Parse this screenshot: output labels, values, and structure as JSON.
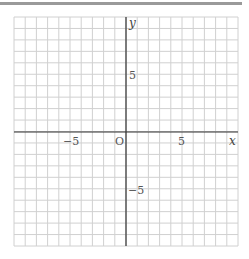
{
  "chart_data": {
    "type": "scatter",
    "title": "",
    "xlabel": "x",
    "ylabel": "y",
    "origin_label": "O",
    "xlim": [
      -10,
      10
    ],
    "ylim": [
      -10,
      10
    ],
    "grid": true,
    "grid_step": 1,
    "x_ticks": [
      {
        "value": -5,
        "label": "−5"
      },
      {
        "value": 5,
        "label": "5"
      }
    ],
    "y_ticks": [
      {
        "value": 5,
        "label": "5"
      },
      {
        "value": -5,
        "label": "−5"
      }
    ],
    "series": []
  },
  "colors": {
    "grid": "#d0d0d0",
    "axis": "#333333",
    "topbar": "#9a9a9a"
  }
}
